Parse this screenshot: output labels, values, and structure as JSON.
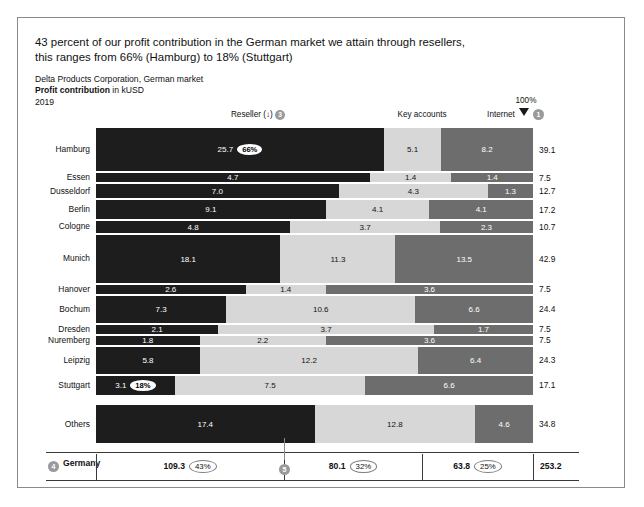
{
  "headline": {
    "line1": "43 percent of our profit contribution in the German market we attain through resellers,",
    "line2": "this ranges from 66% (Hamburg) to 18% (Stuttgart)"
  },
  "subheader": {
    "company": "Delta Products Corporation, German market",
    "measure_bold": "Profit contribution",
    "measure_unit": " in kUSD",
    "year": "2019"
  },
  "annotations": {
    "scale_label": "100%",
    "marker_1": "1",
    "marker_2": "2",
    "marker_3": "3",
    "marker_4": "4",
    "marker_5": "5"
  },
  "columns": {
    "reseller": "Reseller (↓)",
    "key_accounts": "Key accounts",
    "internet": "Internet"
  },
  "colors": {
    "reseller": "#1d1d1d",
    "key_accounts": "#d7d7d7",
    "internet": "#6d6d6d",
    "marker": "#9a9a9a",
    "frame": "#8a8a8a"
  },
  "chart_data": {
    "type": "bar",
    "title": "43 percent of our profit contribution in the German market we attain through resellers, this ranges from 66% (Hamburg) to 18% (Stuttgart)",
    "subtitle": "Delta Products Corporation, German market — Profit contribution in kUSD, 2019",
    "xlabel": "",
    "ylabel": "",
    "stacked": true,
    "normalized_100pct": true,
    "grid": false,
    "legend_position": "top",
    "categories": [
      "Hamburg",
      "Essen",
      "Dusseldorf",
      "Berlin",
      "Cologne",
      "Munich",
      "Hanover",
      "Bochum",
      "Dresden",
      "Nuremberg",
      "Leipzig",
      "Stuttgart",
      "Others"
    ],
    "series": [
      {
        "name": "Reseller",
        "values": [
          25.7,
          4.7,
          7.0,
          9.1,
          4.8,
          18.1,
          2.6,
          7.3,
          2.1,
          1.8,
          5.8,
          3.1,
          17.4
        ]
      },
      {
        "name": "Key accounts",
        "values": [
          5.1,
          1.4,
          4.3,
          4.1,
          3.7,
          11.3,
          1.4,
          10.6,
          3.7,
          2.2,
          12.2,
          7.5,
          12.8
        ]
      },
      {
        "name": "Internet",
        "values": [
          8.2,
          1.4,
          1.3,
          4.1,
          2.3,
          13.5,
          3.6,
          6.6,
          1.7,
          3.6,
          6.4,
          6.6,
          4.6
        ]
      }
    ],
    "totals": [
      39.1,
      7.5,
      12.7,
      17.2,
      10.7,
      42.9,
      7.5,
      24.4,
      7.5,
      7.5,
      24.3,
      17.1,
      34.8
    ],
    "highlight_labels": {
      "Hamburg": "66%",
      "Stuttgart": "18%"
    },
    "summary": {
      "label": "Germany",
      "reseller_value": "109.3",
      "reseller_pct": "43%",
      "key_value": "80.1",
      "key_pct": "32%",
      "internet_value": "63.8",
      "internet_pct": "25%",
      "total": "253.2"
    }
  },
  "rows": [
    {
      "label": "Hamburg",
      "v1": "25.7",
      "v2": "5.1",
      "v3": "8.2",
      "total": "39.1",
      "badge": "66%"
    },
    {
      "label": "Essen",
      "v1": "4.7",
      "v2": "1.4",
      "v3": "1.4",
      "total": "7.5",
      "badge": ""
    },
    {
      "label": "Dusseldorf",
      "v1": "7.0",
      "v2": "4.3",
      "v3": "1.3",
      "total": "12.7",
      "badge": ""
    },
    {
      "label": "Berlin",
      "v1": "9.1",
      "v2": "4.1",
      "v3": "4.1",
      "total": "17.2",
      "badge": ""
    },
    {
      "label": "Cologne",
      "v1": "4.8",
      "v2": "3.7",
      "v3": "2.3",
      "total": "10.7",
      "badge": ""
    },
    {
      "label": "Munich",
      "v1": "18.1",
      "v2": "11.3",
      "v3": "13.5",
      "total": "42.9",
      "badge": ""
    },
    {
      "label": "Hanover",
      "v1": "2.6",
      "v2": "1.4",
      "v3": "3.6",
      "total": "7.5",
      "badge": ""
    },
    {
      "label": "Bochum",
      "v1": "7.3",
      "v2": "10.6",
      "v3": "6.6",
      "total": "24.4",
      "badge": ""
    },
    {
      "label": "Dresden",
      "v1": "2.1",
      "v2": "3.7",
      "v3": "1.7",
      "total": "7.5",
      "badge": ""
    },
    {
      "label": "Nuremberg",
      "v1": "1.8",
      "v2": "2.2",
      "v3": "3.6",
      "total": "7.5",
      "badge": ""
    },
    {
      "label": "Leipzig",
      "v1": "5.8",
      "v2": "12.2",
      "v3": "6.4",
      "total": "24.3",
      "badge": ""
    },
    {
      "label": "Stuttgart",
      "v1": "3.1",
      "v2": "7.5",
      "v3": "6.6",
      "total": "17.1",
      "badge": "18%"
    },
    {
      "label": "Others",
      "v1": "17.4",
      "v2": "12.8",
      "v3": "4.6",
      "total": "34.8",
      "badge": ""
    }
  ]
}
